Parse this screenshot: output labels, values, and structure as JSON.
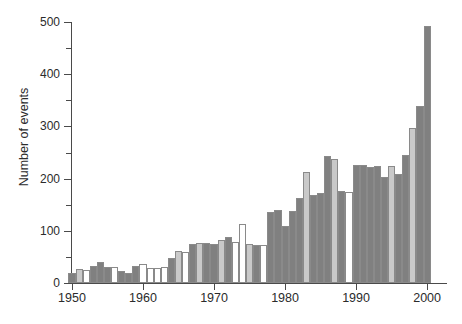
{
  "chart_data": {
    "type": "bar",
    "title": "",
    "xlabel": "",
    "ylabel": "Number of events",
    "ylim": [
      0,
      500
    ],
    "xlim": [
      1949.5,
      2000.5
    ],
    "grid": false,
    "legend": null,
    "y_ticks_major": [
      0,
      100,
      200,
      300,
      400,
      500
    ],
    "y_ticks_minor": [
      50,
      150,
      250,
      350,
      450
    ],
    "x_ticks": [
      1950,
      1960,
      1970,
      1980,
      1990,
      2000
    ],
    "y_tick_labels": [
      "0",
      "100",
      "200",
      "300",
      "400",
      "500"
    ],
    "x_tick_labels": [
      "1950",
      "1960",
      "1970",
      "1980",
      "1990",
      "2000"
    ],
    "colors": {
      "dark_gray": "#808080",
      "light_gray": "#c9c9c9",
      "white": "#ffffff",
      "bar_outline": "#8a8a8a",
      "axis": "#4a4a4a",
      "text": "#2b2b2b"
    },
    "categories": [
      1950,
      1951,
      1952,
      1953,
      1954,
      1955,
      1956,
      1957,
      1958,
      1959,
      1960,
      1961,
      1962,
      1963,
      1964,
      1965,
      1966,
      1967,
      1968,
      1969,
      1970,
      1971,
      1972,
      1973,
      1974,
      1975,
      1976,
      1977,
      1978,
      1979,
      1980,
      1981,
      1982,
      1983,
      1984,
      1985,
      1986,
      1987,
      1988,
      1989,
      1990,
      1991,
      1992,
      1993,
      1994,
      1995,
      1996,
      1997,
      1998,
      1999,
      2000
    ],
    "values": [
      20,
      27,
      24,
      33,
      41,
      31,
      31,
      23,
      20,
      33,
      37,
      29,
      29,
      30,
      47,
      61,
      60,
      75,
      76,
      76,
      75,
      82,
      89,
      79,
      113,
      74,
      72,
      73,
      136,
      140,
      110,
      137,
      162,
      213,
      169,
      172,
      244,
      237,
      177,
      174,
      226,
      227,
      222,
      224,
      203,
      224,
      209,
      245,
      297,
      339,
      493
    ],
    "fills": [
      "dark",
      "light",
      "white",
      "dark",
      "dark",
      "dark",
      "white",
      "dark",
      "dark",
      "dark",
      "white",
      "white",
      "white",
      "white",
      "dark",
      "light",
      "white",
      "dark",
      "light",
      "dark",
      "dark",
      "light",
      "dark",
      "white",
      "white",
      "light",
      "dark",
      "white",
      "dark",
      "dark",
      "dark",
      "dark",
      "dark",
      "light",
      "dark",
      "dark",
      "dark",
      "light",
      "dark",
      "white",
      "dark",
      "dark",
      "dark",
      "dark",
      "dark",
      "light",
      "dark",
      "dark",
      "light",
      "dark",
      "dark"
    ]
  }
}
